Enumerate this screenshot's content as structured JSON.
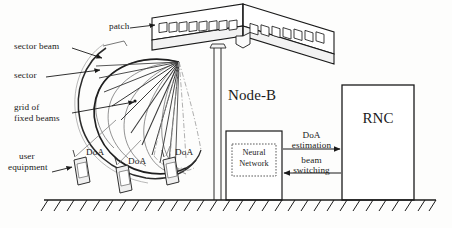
{
  "figure": {
    "ink_color": "#1a1a1a",
    "beam_color": "#5a5a5a",
    "dashed_beam_color": "#8a8a8a"
  },
  "labels": {
    "patch": "patch",
    "sector_beam": "sector beam",
    "sector": "sector",
    "grid_of_fixed_beams_line1": "grid of",
    "grid_of_fixed_beams_line2": "fixed beams",
    "user_equipment_line1": "user",
    "user_equipment_line2": "equipment",
    "doa_1": "DoA",
    "doa_2": "DoA",
    "doa_3": "DoA",
    "node_b": "Node-B",
    "neural_network_line1": "Neural",
    "neural_network_line2": "Network",
    "rnc": "RNC",
    "doa_estimation_line1": "DoA",
    "doa_estimation_line2": "estimation",
    "beam_switching_line1": "beam",
    "beam_switching_line2": "switching"
  }
}
